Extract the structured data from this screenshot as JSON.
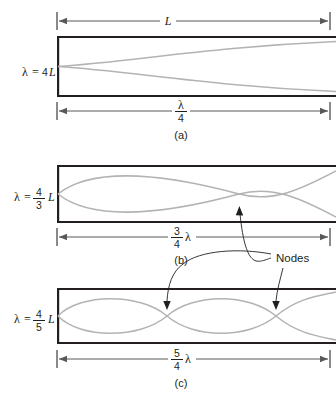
{
  "figure": {
    "wave_color": "#b3b3b3",
    "wall_color": "#231f20",
    "dimension_color": "#58595b",
    "background": "#ffffff",
    "nodes_label": "Nodes"
  },
  "top_dimension": {
    "label": "L"
  },
  "panels": [
    {
      "id": "a",
      "caption": "(a)",
      "lambda_label": {
        "lambda": "λ",
        "equals": "=",
        "value": "4",
        "unit": "L",
        "is_fraction": false,
        "text": "λ = 4L"
      },
      "length_dimension": {
        "numerator": "λ",
        "denominator": "4",
        "is_fraction": true,
        "text": "λ/4"
      },
      "harmonic": 1,
      "loops": 0.5,
      "node_count": 0,
      "node_positions": []
    },
    {
      "id": "b",
      "caption": "(b)",
      "lambda_label": {
        "lambda": "λ",
        "equals": "=",
        "numerator": "4",
        "denominator": "3",
        "unit": "L",
        "is_fraction": true,
        "text": "λ = 4/3 L"
      },
      "length_dimension": {
        "numerator": "3",
        "denominator": "4",
        "suffix": "λ",
        "is_fraction": true,
        "text": "3/4 λ"
      },
      "harmonic": 3,
      "loops": 1.5,
      "node_count": 1,
      "node_positions": [
        0.6667
      ]
    },
    {
      "id": "c",
      "caption": "(c)",
      "lambda_label": {
        "lambda": "λ",
        "equals": "=",
        "numerator": "4",
        "denominator": "5",
        "unit": "L",
        "is_fraction": true,
        "text": "λ = 4/5 L"
      },
      "length_dimension": {
        "numerator": "5",
        "denominator": "4",
        "suffix": "λ",
        "is_fraction": true,
        "text": "5/4 λ"
      },
      "harmonic": 5,
      "loops": 2.5,
      "node_count": 2,
      "node_positions": [
        0.4,
        0.8
      ]
    }
  ]
}
